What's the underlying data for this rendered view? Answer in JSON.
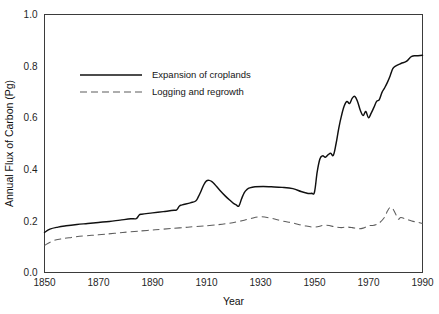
{
  "chart_data": {
    "type": "line",
    "title": "",
    "xlabel": "Year",
    "ylabel": "Annual Flux of Carbon (Pg)",
    "xlim": [
      1850,
      1990
    ],
    "ylim": [
      0.0,
      1.0
    ],
    "grid": false,
    "legend_position": "upper-left-inside",
    "xticks": [
      1850,
      1870,
      1890,
      1910,
      1930,
      1950,
      1970,
      1990
    ],
    "xtick_labels": [
      "1850",
      "1870",
      "1890",
      "1910",
      "1930",
      "1950",
      "1970",
      "1990"
    ],
    "yticks": [
      0.0,
      0.2,
      0.4,
      0.6,
      0.8,
      1.0
    ],
    "ytick_labels": [
      "0.0",
      "0.2",
      "0.4",
      "0.6",
      "0.8",
      "1.0"
    ],
    "series": [
      {
        "name": "Expansion of croplands",
        "style": "solid",
        "color": "#101010",
        "x": [
          1850,
          1852,
          1855,
          1858,
          1862,
          1866,
          1870,
          1874,
          1878,
          1882,
          1884,
          1885,
          1886,
          1890,
          1894,
          1898,
          1899,
          1900,
          1901,
          1904,
          1906,
          1907,
          1908,
          1909,
          1910,
          1911,
          1912,
          1913,
          1915,
          1917,
          1919,
          1920,
          1921,
          1922,
          1923,
          1924,
          1925,
          1926,
          1928,
          1931,
          1934,
          1938,
          1942,
          1945,
          1947,
          1948,
          1949,
          1950,
          1951,
          1952,
          1953,
          1954,
          1955,
          1956,
          1957,
          1958,
          1959,
          1960,
          1961,
          1962,
          1963,
          1964,
          1965,
          1966,
          1967,
          1968,
          1969,
          1970,
          1971,
          1972,
          1973,
          1974,
          1975,
          1976,
          1977,
          1978,
          1979,
          1980,
          1982,
          1984,
          1986,
          1988,
          1990
        ],
        "y": [
          0.155,
          0.168,
          0.176,
          0.181,
          0.186,
          0.19,
          0.194,
          0.198,
          0.203,
          0.208,
          0.209,
          0.222,
          0.226,
          0.231,
          0.236,
          0.241,
          0.243,
          0.258,
          0.262,
          0.27,
          0.277,
          0.294,
          0.316,
          0.34,
          0.355,
          0.357,
          0.352,
          0.342,
          0.318,
          0.296,
          0.277,
          0.268,
          0.262,
          0.258,
          0.286,
          0.31,
          0.322,
          0.328,
          0.332,
          0.333,
          0.332,
          0.33,
          0.325,
          0.314,
          0.308,
          0.306,
          0.307,
          0.312,
          0.39,
          0.44,
          0.452,
          0.447,
          0.456,
          0.462,
          0.455,
          0.5,
          0.56,
          0.608,
          0.645,
          0.663,
          0.655,
          0.676,
          0.682,
          0.661,
          0.628,
          0.608,
          0.624,
          0.6,
          0.618,
          0.64,
          0.663,
          0.67,
          0.698,
          0.716,
          0.737,
          0.762,
          0.79,
          0.8,
          0.81,
          0.818,
          0.838,
          0.84,
          0.842
        ]
      },
      {
        "name": "Logging and regrowth",
        "style": "dashed",
        "color": "#5d5d5d",
        "x": [
          1850,
          1853,
          1856,
          1860,
          1865,
          1870,
          1876,
          1882,
          1888,
          1894,
          1900,
          1906,
          1912,
          1918,
          1922,
          1926,
          1930,
          1934,
          1938,
          1942,
          1946,
          1950,
          1954,
          1958,
          1960,
          1962,
          1964,
          1966,
          1968,
          1970,
          1972,
          1974,
          1976,
          1977,
          1978,
          1979,
          1980,
          1981,
          1982,
          1984,
          1986,
          1988,
          1990
        ],
        "y": [
          0.105,
          0.122,
          0.13,
          0.136,
          0.142,
          0.146,
          0.152,
          0.158,
          0.163,
          0.168,
          0.173,
          0.178,
          0.183,
          0.19,
          0.198,
          0.208,
          0.216,
          0.21,
          0.2,
          0.192,
          0.182,
          0.176,
          0.183,
          0.176,
          0.174,
          0.176,
          0.174,
          0.17,
          0.172,
          0.181,
          0.183,
          0.192,
          0.215,
          0.238,
          0.252,
          0.247,
          0.228,
          0.207,
          0.213,
          0.207,
          0.2,
          0.195,
          0.19
        ]
      }
    ]
  },
  "legend": {
    "items": [
      {
        "label": "Expansion of croplands",
        "style": "solid"
      },
      {
        "label": "Logging and regrowth",
        "style": "dashed"
      }
    ]
  }
}
